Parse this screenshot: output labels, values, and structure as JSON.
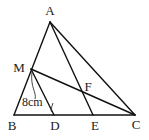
{
  "diagram": {
    "type": "geometry-triangle",
    "points": {
      "A": {
        "label": "A",
        "x": 50,
        "y": 22,
        "lx": 50,
        "ly": 15
      },
      "M": {
        "label": "M",
        "x": 31,
        "y": 69,
        "lx": 19,
        "ly": 72
      },
      "B": {
        "label": "B",
        "x": 14,
        "y": 115,
        "lx": 12,
        "ly": 130
      },
      "D": {
        "label": "D",
        "x": 54,
        "y": 115,
        "lx": 55,
        "ly": 130
      },
      "E": {
        "label": "E",
        "x": 93,
        "y": 115,
        "lx": 95,
        "ly": 130
      },
      "C": {
        "label": "C",
        "x": 135,
        "y": 115,
        "lx": 136,
        "ly": 129
      },
      "F": {
        "label": "F",
        "x": 83,
        "y": 92,
        "lx": 88,
        "ly": 91
      }
    },
    "segments": [
      [
        "A",
        "B"
      ],
      [
        "A",
        "C"
      ],
      [
        "B",
        "C"
      ],
      [
        "A",
        "E"
      ],
      [
        "M",
        "C"
      ],
      [
        "M",
        "D"
      ]
    ],
    "measurement": {
      "segment": [
        "M",
        "D"
      ],
      "text": "8cm",
      "x": 22,
      "y": 106
    },
    "colors": {
      "line": "#111111",
      "text": "#222222",
      "background": "#ffffff"
    }
  }
}
